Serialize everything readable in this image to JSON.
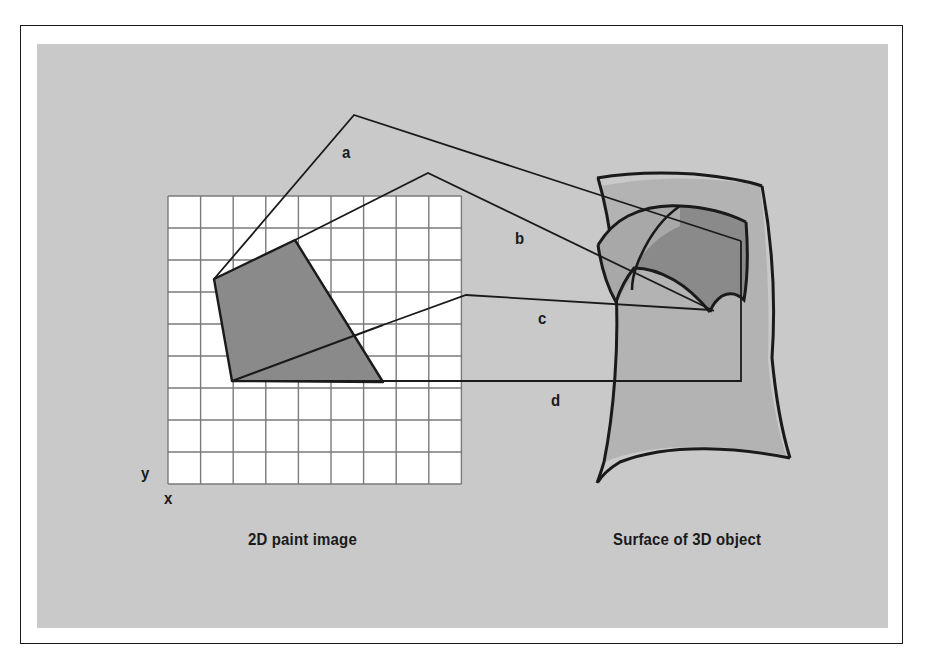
{
  "figure": {
    "captions": {
      "left": "2D paint image",
      "right": "Surface of 3D object"
    },
    "axes": {
      "y_label": "y",
      "x_label": "x"
    },
    "connector_labels": {
      "a": "a",
      "b": "b",
      "c": "c",
      "d": "d"
    },
    "colors": {
      "panel_background": "#c9c9c9",
      "page_background": "#ffffff",
      "frame_stroke": "#1a1a1a",
      "grid_cell_fill": "#ffffff",
      "grid_line": "#7a7a7a",
      "paint_region_fill": "#8a8a8a",
      "surface_fill": "#b3b3b3",
      "surface_patch_fill": "#8a8a8a",
      "line_stroke": "#1a1a1a"
    },
    "grid": {
      "columns": 9,
      "rows": 9,
      "origin_x": 168,
      "origin_y": 196,
      "cell_width": 32.6,
      "cell_height": 32.0
    },
    "paint_region_polygon": "295,240 214,279 232,381 383,382",
    "paint_region_split_line": "232,381 466,295",
    "connectors": [
      {
        "id": "a",
        "path": "214,279 354,115 741,241"
      },
      {
        "id": "b",
        "path": "295,240 428,173 716,309"
      },
      {
        "id": "c",
        "path": "280,347 466,295 711,309"
      },
      {
        "id": "d",
        "path": "232,381 741,381 741,241"
      }
    ]
  }
}
